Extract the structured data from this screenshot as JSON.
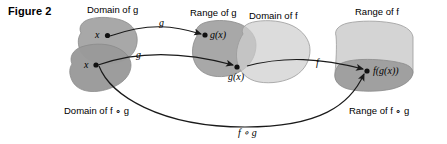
{
  "figure": {
    "caption": "Figure 2"
  },
  "regions": {
    "domain_g": {
      "label": "Domain of g",
      "fill": "#a8a8a8"
    },
    "domain_fog": {
      "label": "Domain of f ∘ g",
      "fill": "#9a9a9a"
    },
    "range_g": {
      "label": "Range of g",
      "fill": "#a8a8a8"
    },
    "domain_f": {
      "label": "Domain of f",
      "fill": "#cfcfcf"
    },
    "range_f": {
      "label": "Range of f",
      "fill": "#d4d4d4"
    },
    "range_fog": {
      "label": "Range of f ∘ g",
      "fill": "#a0a0a0"
    }
  },
  "points": {
    "x_top": "x",
    "x_bottom": "x",
    "gx_top": "g(x)",
    "gx_bottom": "g(x)",
    "fgx": "f(g(x))"
  },
  "arrows": {
    "g_top": "g",
    "g_bottom": "g",
    "f": "f",
    "fog": "f ∘ g"
  },
  "colors": {
    "stroke": "#1a1a1a",
    "text": "#000000",
    "background": "#ffffff",
    "outline": "#8a8a8a"
  }
}
